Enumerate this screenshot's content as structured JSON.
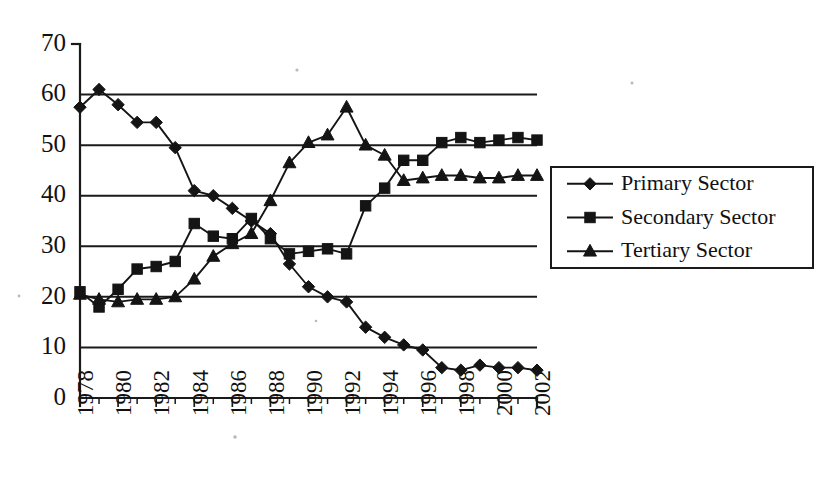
{
  "chart_data": {
    "type": "line",
    "title": "",
    "subtitle": "",
    "xlabel": "",
    "ylabel": "",
    "x": [
      1978,
      1979,
      1980,
      1981,
      1982,
      1983,
      1984,
      1985,
      1986,
      1987,
      1988,
      1989,
      1990,
      1991,
      1992,
      1993,
      1994,
      1995,
      1996,
      1997,
      1998,
      1999,
      2000,
      2001,
      2002
    ],
    "xtick_labels": [
      "1978",
      "1980",
      "1982",
      "1984",
      "1986",
      "1988",
      "1990",
      "1992",
      "1994",
      "1996",
      "1998",
      "2000",
      "2002"
    ],
    "xtick_years": [
      1978,
      1980,
      1982,
      1984,
      1986,
      1988,
      1990,
      1992,
      1994,
      1996,
      1998,
      2000,
      2002
    ],
    "xtick_rotation": -90,
    "ytick_labels": [
      "0",
      "10",
      "20",
      "30",
      "40",
      "50",
      "60",
      "70"
    ],
    "ytick_values": [
      0,
      10,
      20,
      30,
      40,
      50,
      60,
      70
    ],
    "ylim": [
      0,
      70
    ],
    "xlim": [
      1978,
      2002
    ],
    "grid": "horizontal",
    "legend_position": "right",
    "series": [
      {
        "name": "Primary Sector",
        "marker": "diamond",
        "values": [
          57.5,
          61.0,
          58.0,
          54.5,
          54.5,
          49.5,
          41.0,
          40.0,
          37.5,
          35.0,
          32.5,
          26.5,
          22.0,
          20.0,
          19.0,
          14.0,
          12.0,
          10.5,
          9.5,
          6.0,
          5.5,
          6.5,
          6.0,
          6.0,
          5.5
        ]
      },
      {
        "name": "Secondary Sector",
        "marker": "square",
        "values": [
          21.0,
          18.0,
          21.5,
          25.5,
          26.0,
          27.0,
          34.5,
          32.0,
          31.5,
          35.5,
          31.5,
          28.5,
          29.0,
          29.5,
          28.5,
          38.0,
          41.5,
          47.0,
          47.0,
          50.5,
          51.5,
          50.5,
          51.0,
          51.5,
          51.0
        ]
      },
      {
        "name": "Tertiary Sector",
        "marker": "triangle",
        "values": [
          20.5,
          19.5,
          19.0,
          19.5,
          19.5,
          20.0,
          23.5,
          28.0,
          30.5,
          32.5,
          39.0,
          46.5,
          50.5,
          52.0,
          57.5,
          50.0,
          48.0,
          43.0,
          43.5,
          44.0,
          44.0,
          43.5,
          43.5,
          44.0,
          44.0
        ]
      }
    ]
  },
  "legend": {
    "entries": [
      {
        "label": "Primary Sector",
        "marker": "diamond"
      },
      {
        "label": "Secondary Sector",
        "marker": "square"
      },
      {
        "label": "Tertiary Sector",
        "marker": "triangle"
      }
    ]
  },
  "colors": {
    "ink": "#141414",
    "background": "#ffffff"
  }
}
